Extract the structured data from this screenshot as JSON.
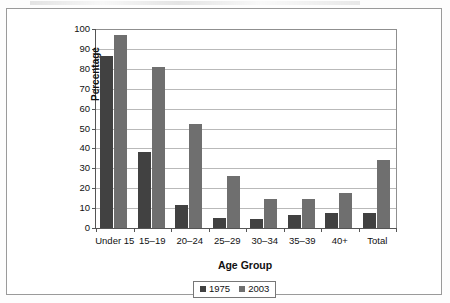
{
  "chart_data": {
    "type": "bar",
    "title": "",
    "xlabel": "Age Group",
    "ylabel": "Percentage",
    "ylim": [
      0,
      100
    ],
    "ytick_step": 10,
    "yticks": [
      100,
      90,
      80,
      70,
      60,
      50,
      40,
      30,
      20,
      10,
      0
    ],
    "grid": true,
    "legend_position": "bottom-center",
    "categories": [
      "Under 15",
      "15–19",
      "20–24",
      "25–29",
      "30–34",
      "35–39",
      "40+",
      "Total"
    ],
    "series": [
      {
        "name": "1975",
        "color": "#414141",
        "values": [
          86.5,
          38,
          11.5,
          5,
          4.5,
          6.5,
          7.5,
          7.5
        ]
      },
      {
        "name": "2003",
        "color": "#6f6f6f",
        "values": [
          97,
          81,
          52.5,
          26,
          14.5,
          14.5,
          17.5,
          34
        ]
      }
    ]
  },
  "legend": {
    "entries": [
      {
        "label": "1975"
      },
      {
        "label": "2003"
      }
    ]
  }
}
